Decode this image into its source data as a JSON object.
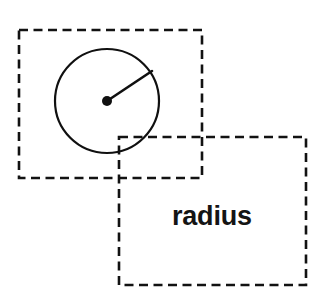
{
  "canvas": {
    "width": 329,
    "height": 306,
    "background_color": "#ffffff",
    "stroke_color": "#101010"
  },
  "diagram": {
    "title_text": "radius",
    "boxes": [
      {
        "name": "circle-box",
        "x": 19,
        "y": 30,
        "width": 183,
        "height": 148,
        "style": "dashed",
        "stroke_color": "#121212",
        "stroke_width": 2.6,
        "dash_pattern": "9 5.5"
      },
      {
        "name": "label-box",
        "x": 119,
        "y": 137,
        "width": 187,
        "height": 148,
        "style": "dashed",
        "stroke_color": "#121212",
        "stroke_width": 2.6,
        "dash_pattern": "9 5.5"
      }
    ],
    "circle": {
      "name": "circle-shape",
      "center_x": 107,
      "center_y": 101,
      "radius": 52,
      "stroke_color": "#101010",
      "stroke_width": 2.2,
      "fill": "none"
    },
    "center_point": {
      "name": "circle-center-dot",
      "x": 107,
      "y": 101,
      "radius": 5,
      "fill_color": "#101010"
    },
    "radius_line": {
      "name": "radius-segment",
      "x1": 107,
      "y1": 101,
      "x2": 152,
      "y2": 71,
      "stroke_color": "#101010",
      "stroke_width": 2.6
    },
    "label": {
      "name": "radius-label",
      "text": "radius",
      "x": 172,
      "y": 204,
      "font_size": 27,
      "font_weight": "bold",
      "color": "#141414"
    }
  }
}
